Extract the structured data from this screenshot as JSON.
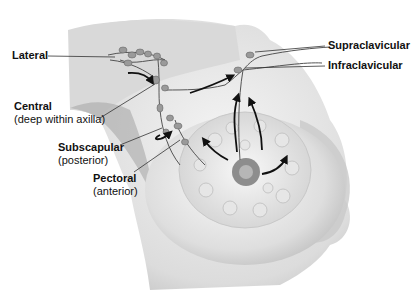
{
  "diagram": {
    "labels": {
      "lateral": {
        "name": "Lateral"
      },
      "central": {
        "name": "Central",
        "note": "(deep within axilla)"
      },
      "subscapular": {
        "name": "Subscapular",
        "note": "(posterior)"
      },
      "pectoral": {
        "name": "Pectoral",
        "note": "(anterior)"
      },
      "supraclavicular": {
        "name": "Supraclavicular"
      },
      "infraclavicular": {
        "name": "Infraclavicular"
      }
    },
    "colors": {
      "skin_light": "#f2f2f2",
      "skin_shade": "#bdbdbd",
      "node": "#9a9a9a",
      "arrow": "#111111",
      "leader": "#333333"
    }
  }
}
